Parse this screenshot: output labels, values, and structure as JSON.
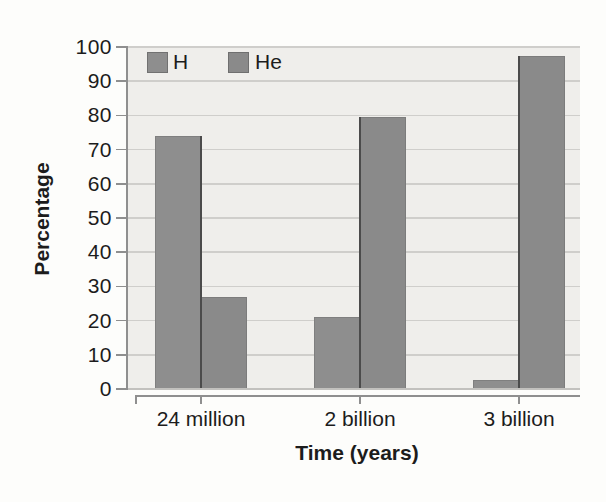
{
  "chart_data": {
    "type": "bar",
    "title": "",
    "categories": [
      "24 million",
      "2 billion",
      "3 billion"
    ],
    "series": [
      {
        "name": "H",
        "color": "#8e8e8e",
        "values": [
          74,
          21,
          2.5
        ]
      },
      {
        "name": "He",
        "color": "#8a8a8a",
        "values": [
          27,
          79.5,
          97.5
        ]
      }
    ],
    "xlabel": "Time (years)",
    "ylabel": "Percentage",
    "ylim": [
      0,
      100
    ],
    "ytick_step": 10,
    "y_tick_labels": [
      "0",
      "10",
      "20",
      "30",
      "40",
      "50",
      "60",
      "70",
      "80",
      "90",
      "100"
    ],
    "grid": true,
    "legend_position": "top-left-inside",
    "colors": {
      "plot_background": "#efeeeb",
      "gridline": "#cfcecb",
      "axis": "#8f8f8f",
      "text": "#1c1c1c",
      "pair_divider": "#4b4b4b"
    }
  }
}
